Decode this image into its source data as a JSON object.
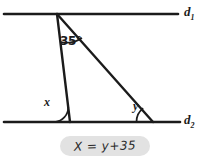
{
  "figure": {
    "type": "geometry-diagram",
    "background": "#ffffff",
    "ink_color": "#1b1b1b",
    "lines": [
      {
        "name": "d1",
        "label": "d",
        "subscript": "1",
        "y": 14,
        "x_start": 4,
        "x_end": 178
      },
      {
        "name": "d2",
        "label": "d",
        "subscript": "2",
        "y": 122,
        "x_start": 4,
        "x_end": 180
      }
    ],
    "triangle": {
      "apex": [
        57,
        14
      ],
      "base_left": [
        70,
        122
      ],
      "base_right": [
        153,
        122
      ]
    },
    "angles": [
      {
        "name": "apex-angle",
        "label": "35°",
        "value": 35,
        "vertex": [
          57,
          14
        ]
      },
      {
        "name": "x-angle",
        "label": "x",
        "vertex": [
          70,
          122
        ]
      },
      {
        "name": "y-angle",
        "label": "y",
        "vertex": [
          153,
          122
        ]
      }
    ]
  },
  "answer": {
    "equation": "X = y+35",
    "pill_color": "#e2e2e2"
  }
}
